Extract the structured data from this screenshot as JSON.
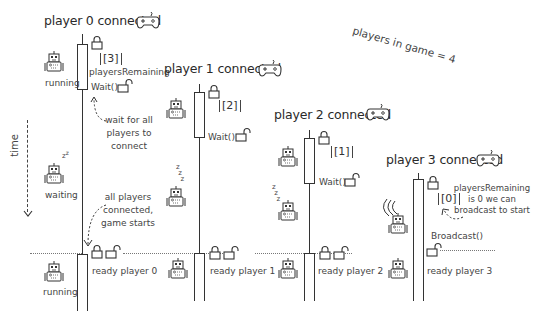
{
  "diagram": {
    "note_top_right": "players in game = 4",
    "time_axis_label": "time",
    "legend": {
      "running_label": "running",
      "waiting_label": "waiting"
    },
    "players": [
      {
        "title": "player 0 connected",
        "counter": "[3]",
        "counter_caption": "playersRemaining",
        "call": "Wait()",
        "ready": "ready player 0"
      },
      {
        "title": "player 1 connected",
        "counter": "[2]",
        "call": "Wait()",
        "ready": "ready player 1"
      },
      {
        "title": "player 2 connected",
        "counter": "[1]",
        "call": "Wait()",
        "ready": "ready player 2"
      },
      {
        "title": "player 3 connected",
        "counter": "[0]",
        "call": "Broadcast()",
        "ready": "ready player 3"
      }
    ],
    "annotations": {
      "wait_note": "wait for all players to connect",
      "start_note": "all players connected, game starts",
      "broadcast_note": "playersRemaining is 0 we can broadcast to start"
    },
    "icons": {
      "gamepad": "gamepad-icon",
      "lock_closed": "lock-closed-icon",
      "lock_open": "lock-open-icon",
      "robot": "robot-icon",
      "sleep": "sleep-zzz-icon",
      "signal": "broadcast-signal-icon"
    }
  }
}
